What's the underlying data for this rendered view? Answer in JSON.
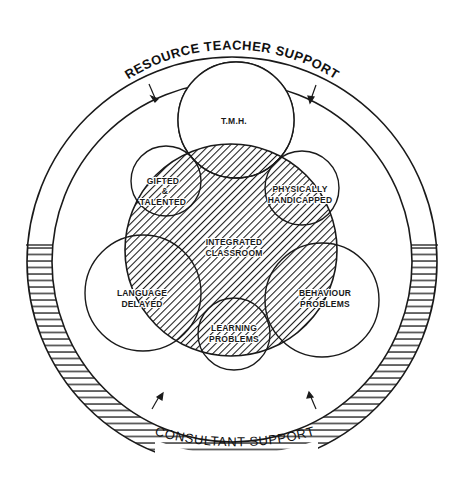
{
  "diagram": {
    "outer_ring": {
      "top_label": "RESOURCE TEACHER SUPPORT",
      "bottom_label": "CONSULTANT SUPPORT"
    },
    "center": {
      "label_line1": "INTEGRATED",
      "label_line2": "CLASSROOM"
    },
    "groups": {
      "tmh": {
        "label_line1": "T.M.H."
      },
      "gifted": {
        "label_line1": "GIFTED",
        "label_line2": "&",
        "label_line3": "TALENTED"
      },
      "physical": {
        "label_line1": "PHYSICALLY",
        "label_line2": "HANDICAPPED"
      },
      "language": {
        "label_line1": "LANGUAGE",
        "label_line2": "DELAYED"
      },
      "behaviour": {
        "label_line1": "BEHAVIOUR",
        "label_line2": "PROBLEMS"
      },
      "learning": {
        "label_line1": "LEARNING",
        "label_line2": "PROBLEMS"
      }
    },
    "colors": {
      "ink": "#1a1a1a",
      "paper": "#ffffff"
    }
  }
}
